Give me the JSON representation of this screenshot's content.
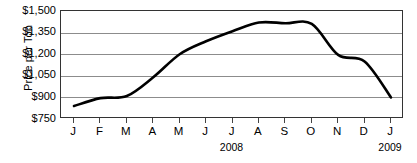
{
  "chart_data": {
    "type": "line",
    "title": "",
    "xlabel": "",
    "ylabel": "Price per Ton",
    "categories": [
      "J",
      "F",
      "M",
      "A",
      "M",
      "J",
      "J",
      "A",
      "S",
      "O",
      "N",
      "D",
      "J"
    ],
    "x_full_labels": [
      "January 2008",
      "February 2008",
      "March 2008",
      "April 2008",
      "May 2008",
      "June 2008",
      "July 2008",
      "August 2008",
      "September 2008",
      "October 2008",
      "November 2008",
      "December 2008",
      "January 2009"
    ],
    "values": [
      840,
      895,
      910,
      1040,
      1200,
      1290,
      1360,
      1420,
      1415,
      1410,
      1195,
      1150,
      900
    ],
    "ylim": [
      750,
      1500
    ],
    "yticks": [
      750,
      900,
      1050,
      1200,
      1350,
      1500
    ],
    "ytick_labels": [
      "$750",
      "$900",
      "$1,050",
      "$1,200",
      "$1,350",
      "$1,500"
    ],
    "grid": "horizontal",
    "legend": "none",
    "series_color": "#000000",
    "grid_color": "#8c8c8c",
    "axis_color": "#333333",
    "year_captions": [
      {
        "label": "2008",
        "at_category_index": 6
      },
      {
        "label": "2009",
        "at_category_index": 12
      }
    ]
  },
  "axis": {
    "y_title": "Price per Ton"
  }
}
